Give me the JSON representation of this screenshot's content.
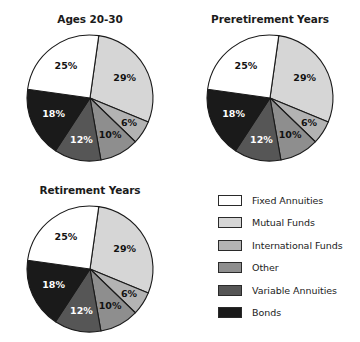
{
  "chart_data": [
    {
      "type": "pie",
      "title": "Ages 20-30",
      "labels": [
        "Mutual Funds",
        "International Funds",
        "Other",
        "Variable Annuities",
        "Bonds",
        "Fixed Annuities"
      ],
      "values": [
        29,
        6,
        10,
        12,
        18,
        25
      ],
      "value_labels": [
        "29%",
        "6%",
        "10%",
        "12%",
        "18%",
        "25%"
      ],
      "colors": [
        "#d6d6d6",
        "#b3b3b3",
        "#8e8e8e",
        "#565656",
        "#1a1a1a",
        "#ffffff"
      ],
      "start_angle_deg": 8,
      "legend_position": "bottom-right",
      "grid": false
    },
    {
      "type": "pie",
      "title": "Preretirement Years",
      "labels": [
        "Mutual Funds",
        "International Funds",
        "Other",
        "Variable Annuities",
        "Bonds",
        "Fixed Annuities"
      ],
      "values": [
        29,
        6,
        10,
        12,
        18,
        25
      ],
      "value_labels": [
        "29%",
        "6%",
        "10%",
        "12%",
        "18%",
        "25%"
      ],
      "colors": [
        "#d6d6d6",
        "#b3b3b3",
        "#8e8e8e",
        "#565656",
        "#1a1a1a",
        "#ffffff"
      ],
      "start_angle_deg": 8,
      "legend_position": "bottom-right",
      "grid": false
    },
    {
      "type": "pie",
      "title": "Retirement Years",
      "labels": [
        "Mutual Funds",
        "International Funds",
        "Other",
        "Variable Annuities",
        "Bonds",
        "Fixed Annuities"
      ],
      "values": [
        29,
        6,
        10,
        12,
        18,
        25
      ],
      "value_labels": [
        "29%",
        "6%",
        "10%",
        "12%",
        "18%",
        "25%"
      ],
      "colors": [
        "#d6d6d6",
        "#b3b3b3",
        "#8e8e8e",
        "#565656",
        "#1a1a1a",
        "#ffffff"
      ],
      "start_angle_deg": 8,
      "legend_position": "bottom-right",
      "grid": false
    }
  ],
  "charts": [
    {
      "title": "Ages 20-30"
    },
    {
      "title": "Preretirement Years"
    },
    {
      "title": "Retirement Years"
    }
  ],
  "legend": {
    "items": [
      {
        "label": "Fixed Annuities",
        "color": "#ffffff"
      },
      {
        "label": "Mutual Funds",
        "color": "#d6d6d6"
      },
      {
        "label": "International Funds",
        "color": "#b3b3b3"
      },
      {
        "label": "Other",
        "color": "#8e8e8e"
      },
      {
        "label": "Variable Annuities",
        "color": "#565656"
      },
      {
        "label": "Bonds",
        "color": "#1a1a1a"
      }
    ]
  },
  "style": {
    "background": "#ffffff",
    "outline": "#1a1a1a",
    "label_on_dark": "#ffffff",
    "label_on_light": "#121212"
  }
}
